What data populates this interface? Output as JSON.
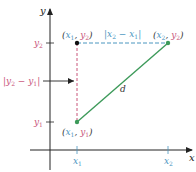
{
  "figure": {
    "axes": {
      "x_label": "x",
      "y_label": "y"
    },
    "ticks": {
      "x1": {
        "base": "x",
        "sub": "1"
      },
      "x2": {
        "base": "x",
        "sub": "2"
      },
      "y1": {
        "base": "y",
        "sub": "1"
      },
      "y2": {
        "base": "y",
        "sub": "2"
      }
    },
    "points": {
      "p_x1_y2": {
        "label_open": "(",
        "x": "x",
        "xsub": "1",
        "sep": ", ",
        "y": "y",
        "ysub": "2",
        "label_close": ")"
      },
      "p_x2_y2": {
        "label_open": "(",
        "x": "x",
        "xsub": "2",
        "sep": ", ",
        "y": "y",
        "ysub": "2",
        "label_close": ")"
      },
      "p_x1_y1": {
        "label_open": "(",
        "x": "x",
        "xsub": "1",
        "sep": ", ",
        "y": "y",
        "ysub": "1",
        "label_close": ")"
      }
    },
    "annotations": {
      "horizontal_distance": {
        "bar_l": "|",
        "a": "x",
        "asub": "2",
        "minus": " − ",
        "b": "x",
        "bsub": "1",
        "bar_r": "|"
      },
      "vertical_distance": {
        "bar_l": "|",
        "a": "y",
        "asub": "2",
        "minus": " − ",
        "b": "y",
        "bsub": "1",
        "bar_r": "|"
      },
      "distance_label": "d"
    },
    "colors": {
      "x_color": "#4a96bf",
      "y_color": "#c9557a",
      "segment": "#3d9a5a",
      "axis": "#222222",
      "text": "#333333"
    }
  }
}
